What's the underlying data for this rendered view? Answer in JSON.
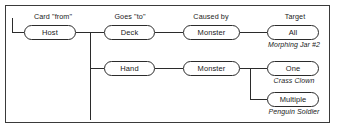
{
  "diagram": {
    "frame": {
      "border_color": "#3a3a3a"
    },
    "line_color": "#2b2b2b",
    "column_headers": [
      {
        "name": "card-from",
        "label": "Card \"from\""
      },
      {
        "name": "goes-to",
        "label": "Goes \"to\""
      },
      {
        "name": "caused-by",
        "label": "Caused by"
      },
      {
        "name": "target",
        "label": "Target"
      }
    ],
    "nodes": [
      {
        "name": "host",
        "label": "Host"
      },
      {
        "name": "deck",
        "label": "Deck"
      },
      {
        "name": "monster-top",
        "label": "Monster"
      },
      {
        "name": "all",
        "label": "All"
      },
      {
        "name": "hand",
        "label": "Hand"
      },
      {
        "name": "monster-bottom",
        "label": "Monster"
      },
      {
        "name": "one",
        "label": "One"
      },
      {
        "name": "multiple",
        "label": "Multiple"
      }
    ],
    "captions": [
      {
        "name": "caption-all",
        "label": "Morphing Jar #2"
      },
      {
        "name": "caption-one",
        "label": "Crass Clown"
      },
      {
        "name": "caption-multiple",
        "label": "Penguin Soldier"
      }
    ]
  }
}
